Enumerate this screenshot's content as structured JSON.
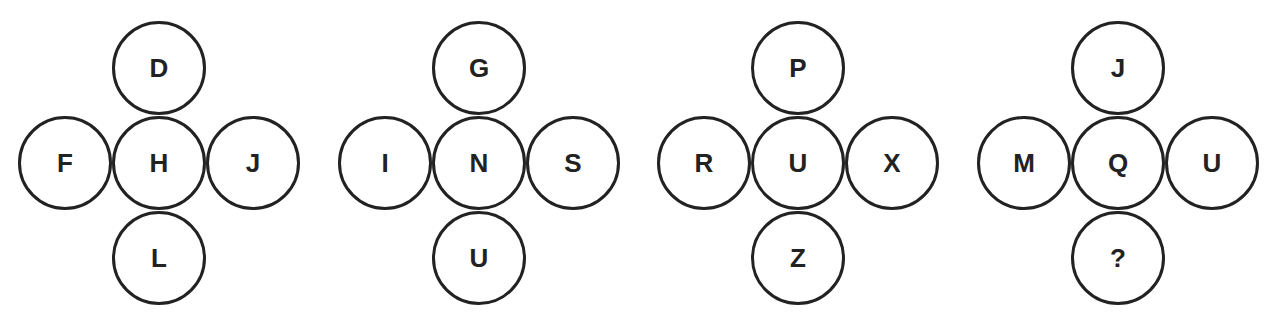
{
  "puzzle": {
    "clusters": [
      {
        "top": "D",
        "left": "F",
        "center": "H",
        "right": "J",
        "bottom": "L"
      },
      {
        "top": "G",
        "left": "I",
        "center": "N",
        "right": "S",
        "bottom": "U"
      },
      {
        "top": "P",
        "left": "R",
        "center": "U",
        "right": "X",
        "bottom": "Z"
      },
      {
        "top": "J",
        "left": "M",
        "center": "Q",
        "right": "U",
        "bottom": "?"
      }
    ]
  },
  "colors": {
    "stroke": "#222222",
    "background": "#ffffff"
  }
}
